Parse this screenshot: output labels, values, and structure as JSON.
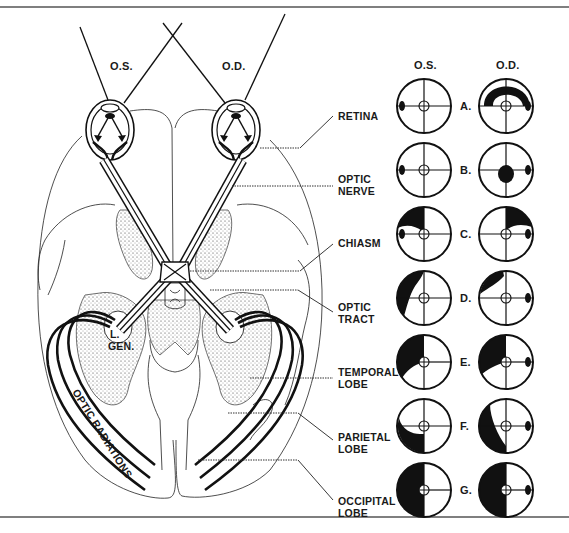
{
  "diagram": {
    "type": "anatomy-visual-pathway",
    "eye_labels": {
      "left": "O.S.",
      "right": "O.D."
    },
    "structure_labels": [
      {
        "id": "retina",
        "lines": [
          "RETINA"
        ]
      },
      {
        "id": "optic-nerve",
        "lines": [
          "OPTIC",
          "NERVE"
        ]
      },
      {
        "id": "chiasm",
        "lines": [
          "CHIASM"
        ]
      },
      {
        "id": "optic-tract",
        "lines": [
          "OPTIC",
          "TRACT"
        ]
      },
      {
        "id": "temporal-lobe",
        "lines": [
          "TEMPORAL",
          "LOBE"
        ]
      },
      {
        "id": "parietal-lobe",
        "lines": [
          "PARIETAL",
          "LOBE"
        ]
      },
      {
        "id": "occipital-lobe",
        "lines": [
          "OCCIPITAL",
          "LOBE"
        ]
      }
    ],
    "inline_labels": {
      "lateral_geniculate": [
        "L.",
        "GEN."
      ],
      "optic_radiations": "OPTIC RADIATIONS"
    }
  },
  "visual_fields": {
    "column_headers": {
      "os": "O.S.",
      "od": "O.D."
    },
    "rows": [
      {
        "letter": "A.",
        "os_defect": "none (blind spot only)",
        "od_defect": "arcuate scotoma (superior)"
      },
      {
        "letter": "B.",
        "os_defect": "none (blind spot only)",
        "od_defect": "central scotoma"
      },
      {
        "letter": "C.",
        "os_defect": "superior temporal quadrant",
        "od_defect": "superior temporal quadrant"
      },
      {
        "letter": "D.",
        "os_defect": "incongruous temporal crescent",
        "od_defect": "incongruous nasal wedge"
      },
      {
        "letter": "E.",
        "os_defect": "left superior quadrantanopia (temporal lobe)",
        "od_defect": "left superior quadrantanopia (temporal lobe)"
      },
      {
        "letter": "F.",
        "os_defect": "left inferior quadrantanopia (parietal lobe)",
        "od_defect": "left inferior quadrantanopia (parietal lobe)"
      },
      {
        "letter": "G.",
        "os_defect": "left homonymous hemianopia",
        "od_defect": "left homonymous hemianopia"
      }
    ]
  },
  "colors": {
    "ink": "#111111",
    "paper": "#ffffff",
    "rule": "#555555"
  }
}
